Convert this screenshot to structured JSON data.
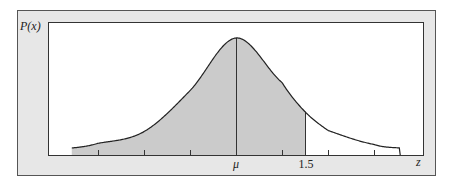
{
  "chart_data": {
    "type": "area",
    "title": "",
    "ylabel": "P(x)",
    "xlabel": "z",
    "x_tick_labels": [
      {
        "value": 0,
        "label": "μ"
      },
      {
        "value": 1.5,
        "label": "1.5"
      }
    ],
    "x_ticks": [
      -3,
      -2,
      -1,
      0,
      1,
      2,
      3
    ],
    "xlim": [
      -3.57,
      3.57
    ],
    "shaded_region": {
      "from": -3.57,
      "to": 1.5
    },
    "mean_marker": 0,
    "cut_marker": 1.5,
    "curve_points_relative_height": [
      {
        "z": -3.57,
        "h": 0.06
      },
      {
        "z": -3.0,
        "h": 0.1
      },
      {
        "z": -2.0,
        "h": 0.2
      },
      {
        "z": -1.0,
        "h": 0.55
      },
      {
        "z": 0.0,
        "h": 1.0
      },
      {
        "z": 1.0,
        "h": 0.62
      },
      {
        "z": 1.5,
        "h": 0.37
      },
      {
        "z": 2.0,
        "h": 0.21
      },
      {
        "z": 3.0,
        "h": 0.09
      },
      {
        "z": 3.57,
        "h": 0.06
      }
    ],
    "grid": false,
    "legend": null
  },
  "colors": {
    "frame_bg": "#e7e7e7",
    "plot_bg": "#ffffff",
    "shade": "#cbcbcb",
    "line": "#333333"
  }
}
